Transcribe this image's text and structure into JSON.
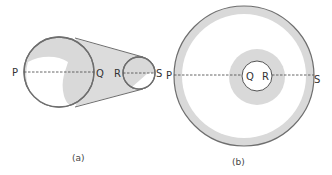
{
  "figure_a": {
    "caption": "(a)",
    "labels": {
      "P": "P",
      "Q": "Q",
      "R": "R",
      "S": "S"
    }
  },
  "figure_b": {
    "caption": "(b)",
    "labels": {
      "P": "P",
      "Q": "Q",
      "R": "R",
      "S": "S"
    }
  },
  "colors": {
    "stroke": "#6e6e6e",
    "shade": "#d9d9d9",
    "dashed_line": "#555555",
    "background": "#ffffff"
  }
}
